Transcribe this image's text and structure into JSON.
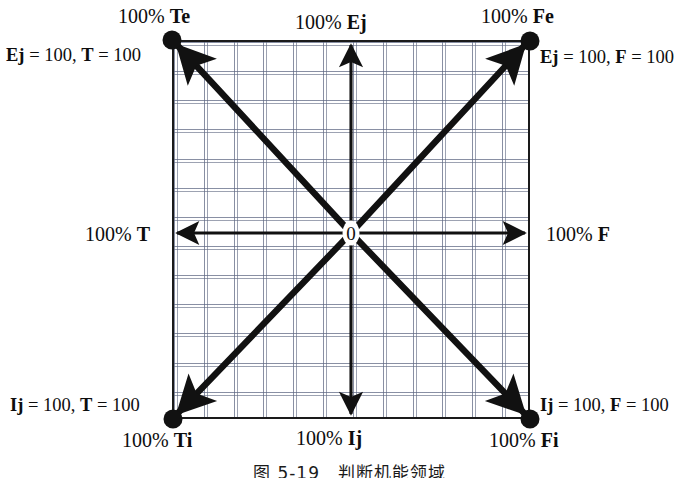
{
  "figure": {
    "type": "quadrant-axes-diagram",
    "origin_label": "0",
    "caption": "图 5-19　判断机能领域"
  },
  "axis_labels": {
    "top": "100% Ej",
    "bottom": "100% Ij",
    "left": "100% T",
    "right": "100% F"
  },
  "corner_outer_labels": {
    "top_left": "100% Te",
    "top_right": "100% Fe",
    "bottom_left": "100% Ti",
    "bottom_right": "100% Fi"
  },
  "corner_equations": {
    "top_left": "Ej = 100, T = 100",
    "top_right": "Ej = 100, F = 100",
    "bottom_left": "Ij = 100, T = 100",
    "bottom_right": "Ij = 100, F = 100"
  },
  "chart_data": {
    "type": "scatter",
    "title": "",
    "xlabel": "",
    "ylabel": "",
    "xlim": [
      -100,
      100
    ],
    "ylim": [
      -100,
      100
    ],
    "grid": true,
    "legend": "none",
    "x_axis_negative": "100% T",
    "x_axis_positive": "100% F",
    "y_axis_positive": "100% Ej",
    "y_axis_negative": "100% Ij",
    "grid_columns": 12,
    "grid_rows": 13,
    "points": [
      {
        "name": "Te",
        "label": "100% Te",
        "equation": "Ej = 100, T = 100",
        "x": -100,
        "y": 100
      },
      {
        "name": "Fe",
        "label": "100% Fe",
        "equation": "Ej = 100, F = 100",
        "x": 100,
        "y": 100
      },
      {
        "name": "Ti",
        "label": "100% Ti",
        "equation": "Ij = 100, T = 100",
        "x": -100,
        "y": -100
      },
      {
        "name": "Fi",
        "label": "100% Fi",
        "equation": "Ij = 100, F = 100",
        "x": 100,
        "y": -100
      },
      {
        "name": "origin",
        "label": "0",
        "equation": "",
        "x": 0,
        "y": 0
      }
    ],
    "diagonals": [
      {
        "from": "Te",
        "to": "Fi"
      },
      {
        "from": "Fe",
        "to": "Ti"
      }
    ]
  },
  "colors": {
    "line": "#111111",
    "grid": "#5a6482",
    "background": "#ffffff"
  }
}
